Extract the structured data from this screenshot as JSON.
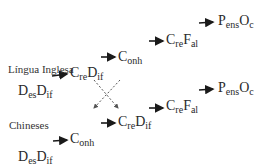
{
  "groups": [
    {
      "label": "Língua Inglesa",
      "nodes": [
        {
          "main1": "D",
          "sub1": "es",
          "main2": "D",
          "sub2": "if"
        },
        {
          "main1": "C",
          "sub1": "re",
          "main2": "D",
          "sub2": "if"
        },
        {
          "main1": "C",
          "sub1": "onh",
          "main2": "",
          "sub2": ""
        },
        {
          "main1": "C",
          "sub1": "re",
          "main2": "F",
          "sub2": "al"
        },
        {
          "main1": "P",
          "sub1": "ens",
          "main2": "O",
          "sub2": "c"
        }
      ]
    },
    {
      "label": "Chineses",
      "nodes": [
        {
          "main1": "D",
          "sub1": "es",
          "main2": "D",
          "sub2": "if"
        },
        {
          "main1": "C",
          "sub1": "onh",
          "main2": "",
          "sub2": ""
        },
        {
          "main1": "C",
          "sub1": "re",
          "main2": "D",
          "sub2": "if"
        },
        {
          "main1": "C",
          "sub1": "re",
          "main2": "F",
          "sub2": "al"
        },
        {
          "main1": "P",
          "sub1": "ens",
          "main2": "O",
          "sub2": "c"
        }
      ]
    }
  ],
  "colors": {
    "text": "#2a2a2a",
    "arrow": "#1a1a1a",
    "dashed": "#555555"
  }
}
